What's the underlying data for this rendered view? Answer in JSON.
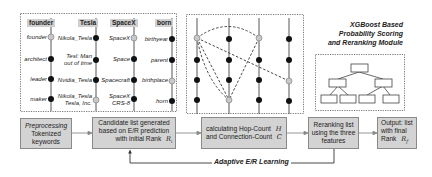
{
  "entity_panel": {
    "columns": [
      {
        "header": "founder",
        "items": [
          "founder",
          "architect",
          "leader",
          "maker"
        ],
        "highlighted": [
          0
        ]
      },
      {
        "header": "Tesla",
        "items": [
          "Nikola_Tesla",
          "Tesl: Man out of time",
          "Nvidia_Tesla",
          "Nikola_Tesla Tesla, Inc."
        ],
        "highlighted": [
          3
        ]
      },
      {
        "header": "SpaceX",
        "items": [
          "SpaceX",
          "Space",
          "Spacecraft",
          "SpaceX CRS-8"
        ],
        "highlighted": [
          0
        ]
      },
      {
        "header": "born",
        "items": [
          "birthyear",
          "parent",
          "birthplace",
          "horn"
        ],
        "highlighted": [
          2
        ]
      }
    ],
    "tesla_item_1_line1": "Tesl: Man",
    "tesla_item_1_line2": "out of time",
    "tesla_item_3_line1": "Nikola_Tesla",
    "tesla_item_3_line2": "Tesla, Inc.",
    "spacex_item_3_line1": "SpaceX",
    "spacex_item_3_line2": "CRS-8"
  },
  "graph_panel": {
    "columns": 4,
    "rows": 4,
    "highlighted_nodes": [
      [
        0,
        0
      ],
      [
        2,
        0
      ],
      [
        3,
        2
      ],
      [
        1,
        3
      ]
    ]
  },
  "module": {
    "title_line1": "XGBoost Based",
    "title_line2": "Probability Scoring",
    "title_line3": "and Reranking Module"
  },
  "pipeline": {
    "step1": {
      "line1": "Preprocessing",
      "line2": "Tokenized",
      "line3": "keywords"
    },
    "step2": {
      "line1": "Candidate list generated",
      "line2": "based on E/R prediction",
      "line3": "with initial Rank",
      "symbol": "R",
      "subscript": "i"
    },
    "step3": {
      "line1": "calculating Hop-Count",
      "symbol1": "H",
      "line2": "and Connection-Count",
      "symbol2": "C"
    },
    "step4": {
      "line1": "Reranking list",
      "line2": "using the three",
      "line3": "features"
    },
    "step5": {
      "line1": "Output: list",
      "line2": "with final",
      "line3": "Rank",
      "symbol": "R",
      "subscript": "f"
    },
    "feedback_label": "Adaptive E/R Learning"
  },
  "colors": {
    "box_fill": "#d3d3d3",
    "node_dark": "#111111",
    "node_highlight": "#c8c8c8",
    "line": "#555555"
  }
}
